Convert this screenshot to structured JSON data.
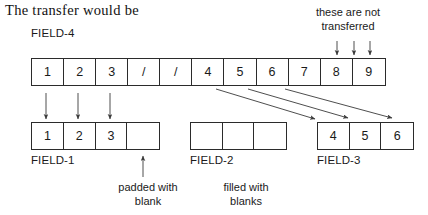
{
  "heading": {
    "text": "The transfer would be"
  },
  "source": {
    "label": "FIELD-4",
    "cells": [
      "1",
      "2",
      "3",
      "/",
      "/",
      "4",
      "5",
      "6",
      "7",
      "8",
      "9"
    ]
  },
  "targets": [
    {
      "id": "field-1",
      "label": "FIELD-1",
      "cells": [
        "1",
        "2",
        "3",
        ""
      ]
    },
    {
      "id": "field-2",
      "label": "FIELD-2",
      "cells": [
        "",
        "",
        ""
      ]
    },
    {
      "id": "field-3",
      "label": "FIELD-3",
      "cells": [
        "4",
        "5",
        "6"
      ]
    }
  ],
  "annotations": {
    "not_transferred": "these are not\ntransferred",
    "not_transferred_line1": "these are not",
    "not_transferred_line2": "transferred",
    "padded_line1": "padded with",
    "padded_line2": "blank",
    "filled_line1": "filled with",
    "filled_line2": "blanks"
  },
  "colors": {
    "stroke": "#2b2b2b",
    "arrow": "#3a3a3a",
    "text": "#1a1a1a",
    "background": "#ffffff"
  }
}
